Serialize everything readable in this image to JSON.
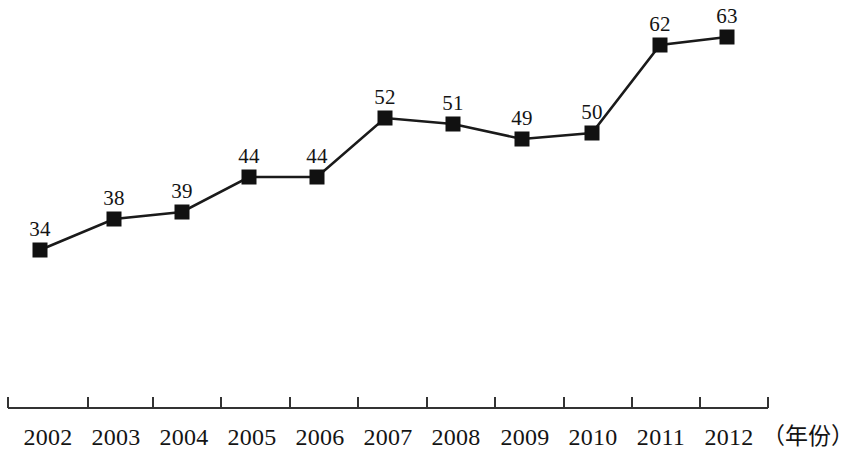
{
  "chart_data": {
    "type": "line",
    "title": "",
    "subtitle": "",
    "xlabel": "年份",
    "ylabel": "",
    "grid": false,
    "legend": null,
    "axis_unit_suffix": "（年份）",
    "categories": [
      "2002",
      "2003",
      "2004",
      "2005",
      "2006",
      "2007",
      "2008",
      "2009",
      "2010",
      "2011",
      "2012"
    ],
    "values": [
      34,
      38,
      39,
      44,
      44,
      52,
      51,
      49,
      50,
      62,
      63
    ],
    "point_labels": [
      "34",
      "38",
      "39",
      "44",
      "44",
      "52",
      "51",
      "49",
      "50",
      "62",
      "63"
    ],
    "series": [
      {
        "name": "",
        "values": [
          34,
          38,
          39,
          44,
          44,
          52,
          51,
          49,
          50,
          62,
          63
        ],
        "marker": "filled-square",
        "color": "#1a1a1a"
      }
    ],
    "xlim": [
      2002,
      2012
    ],
    "ylim": [
      0,
      68
    ],
    "x_axis_visible": true,
    "y_axis_visible": false,
    "tick_direction": "down",
    "colors": {
      "line": "#1a1a1a",
      "marker": "#111111",
      "axis": "#333333",
      "text": "#141414",
      "background": "#ffffff"
    }
  },
  "geometry": {
    "points": [
      {
        "x": 40,
        "y": 250,
        "label_x": 40,
        "label_y": 240
      },
      {
        "x": 114,
        "y": 219,
        "label_x": 114,
        "label_y": 209
      },
      {
        "x": 182,
        "y": 212,
        "label_x": 182,
        "label_y": 202
      },
      {
        "x": 249,
        "y": 177,
        "label_x": 249,
        "label_y": 167
      },
      {
        "x": 317,
        "y": 177,
        "label_x": 317,
        "label_y": 167
      },
      {
        "x": 385,
        "y": 118,
        "label_x": 385,
        "label_y": 108
      },
      {
        "x": 453,
        "y": 124,
        "label_x": 453,
        "label_y": 114
      },
      {
        "x": 522,
        "y": 139,
        "label_x": 522,
        "label_y": 129
      },
      {
        "x": 592,
        "y": 133,
        "label_x": 592,
        "label_y": 123
      },
      {
        "x": 660,
        "y": 45,
        "label_x": 660,
        "label_y": 35
      },
      {
        "x": 727,
        "y": 37,
        "label_x": 727,
        "label_y": 27
      }
    ],
    "axis": {
      "x1": 8,
      "x2": 768,
      "y": 408,
      "tick_length": 11
    },
    "ticks_x": [
      8,
      88,
      153,
      221,
      290,
      358,
      427,
      495,
      564,
      632,
      700,
      768
    ],
    "tick_label_x": [
      48,
      116,
      184,
      252,
      320,
      388,
      456,
      525,
      593,
      661,
      729
    ],
    "tick_label_y": 425,
    "unit_label_x": 762,
    "unit_label_y": 425
  }
}
